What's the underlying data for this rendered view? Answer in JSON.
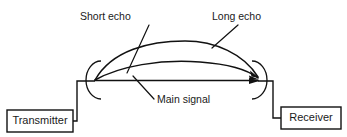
{
  "diagram": {
    "background_color": "#ffffff",
    "line_color": "#111111",
    "boxes": [
      {
        "id": "transmitter",
        "label": "Transmitter",
        "x": 7,
        "y": 110,
        "width": 66,
        "height": 22
      },
      {
        "id": "receiver",
        "label": "Receiver",
        "x": 281,
        "y": 107,
        "width": 60,
        "height": 22
      }
    ],
    "annotations": [
      {
        "id": "short-echo",
        "label": "Short echo",
        "text_x": 80,
        "text_y": 17,
        "leader": "M 149 25 L 127 73"
      },
      {
        "id": "long-echo",
        "label": "Long echo",
        "text_x": 212,
        "text_y": 17,
        "leader": "M 238 25 L 212 48"
      },
      {
        "id": "main-signal",
        "label": "Main signal",
        "text_x": 157,
        "text_y": 100,
        "leader": "M 133 76 L 154 99"
      }
    ],
    "signal_paths": [
      {
        "id": "long-echo-path",
        "name": "Long echo",
        "d": "M 95 80 C 112 50, 150 41, 185 41 C 215 41, 244 54, 258 77"
      },
      {
        "id": "short-echo-path",
        "name": "Short echo",
        "d": "M 95 80 C 120 66, 160 59, 200 62 C 228 64, 248 70, 258 78"
      },
      {
        "id": "main-signal-path",
        "name": "Main signal",
        "d": "M 95 80.5 L 258 80.5"
      }
    ],
    "antennas": [
      {
        "id": "transmitter-antenna",
        "arc": "M 101 61 A 15 19 0 1 0 101 99"
      },
      {
        "id": "receiver-antenna",
        "arc": "M 252 61 A 15 19 0 1 1 252 99"
      }
    ],
    "connectors": [
      {
        "id": "transmitter-connector",
        "d": "M 95 81 L 77 81 L 77 121 L 73 121"
      },
      {
        "id": "receiver-connector",
        "d": "M 258 81 L 273 81 L 273 118 L 281 118"
      }
    ]
  }
}
